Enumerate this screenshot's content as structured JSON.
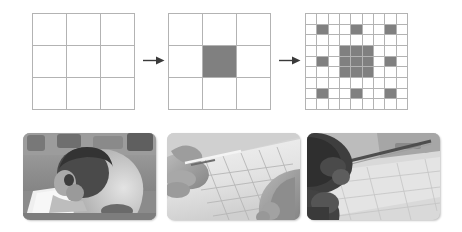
{
  "figure": {
    "colors": {
      "fill_gray": "#808080",
      "grid_line": "#b3b3b3",
      "arrow": "#3a3a3a",
      "background": "#ffffff"
    }
  },
  "diagram": {
    "name": "sierpinski-carpet-stages",
    "stages": [
      {
        "id": "stage-0",
        "label": "Stage 0",
        "grid_size": 3,
        "filled_cells": []
      },
      {
        "id": "stage-1",
        "label": "Stage 1",
        "grid_size": 3,
        "filled_cells": [
          [
            1,
            1
          ]
        ]
      },
      {
        "id": "stage-2",
        "label": "Stage 2",
        "grid_size": 9,
        "filled_cells": [
          [
            1,
            1
          ],
          [
            1,
            4
          ],
          [
            1,
            7
          ],
          [
            3,
            3
          ],
          [
            3,
            4
          ],
          [
            3,
            5
          ],
          [
            4,
            1
          ],
          [
            4,
            3
          ],
          [
            4,
            4
          ],
          [
            4,
            5
          ],
          [
            4,
            7
          ],
          [
            5,
            3
          ],
          [
            5,
            4
          ],
          [
            5,
            5
          ],
          [
            7,
            1
          ],
          [
            7,
            4
          ],
          [
            7,
            7
          ]
        ]
      }
    ],
    "arrows": [
      {
        "id": "arrow-1",
        "label": "leads to",
        "direction": "right"
      },
      {
        "id": "arrow-2",
        "label": "leads to",
        "direction": "right"
      }
    ]
  },
  "photos": [
    {
      "id": "photo-classroom-student",
      "alt": "Student leaning over desk drawing on white paper in a classroom",
      "tone": "grayscale"
    },
    {
      "id": "photo-hands-drawing-grid",
      "alt": "Close-up of hands drawing a square grid on paper with a pencil",
      "tone": "grayscale"
    },
    {
      "id": "photo-student-with-ruler",
      "alt": "Student using a ruler to draw lines on paper at a desk",
      "tone": "grayscale"
    }
  ]
}
